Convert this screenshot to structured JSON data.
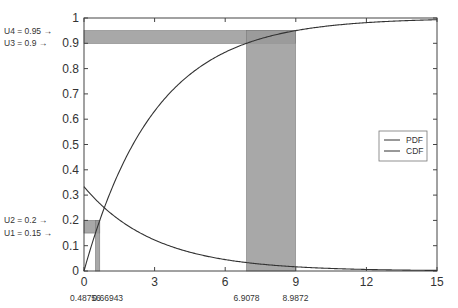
{
  "chart_data": {
    "type": "line",
    "title": "",
    "xlabel": "",
    "ylabel": "",
    "xlim": [
      0,
      15
    ],
    "ylim": [
      0,
      1
    ],
    "grid": false,
    "legend_position": "right-middle",
    "x_ticks": [
      0,
      3,
      6,
      9,
      12,
      15
    ],
    "y_ticks": [
      0,
      0.1,
      0.2,
      0.3,
      0.4,
      0.5,
      0.6,
      0.7,
      0.8,
      0.9,
      1
    ],
    "series": [
      {
        "name": "PDF",
        "function": "(1/3)*exp(-x/3)",
        "x": [
          0,
          3,
          6,
          9,
          12,
          15
        ],
        "values": [
          0.3333,
          0.1226,
          0.0451,
          0.0166,
          0.0061,
          0.0022
        ]
      },
      {
        "name": "CDF",
        "function": "1-exp(-x/3)",
        "x": [
          0,
          3,
          6,
          9,
          12,
          15
        ],
        "values": [
          0,
          0.6321,
          0.8647,
          0.9502,
          0.9817,
          0.9933
        ]
      }
    ],
    "annotations": {
      "u_labels": [
        {
          "label": "U4 = 0.95 →",
          "y": 0.95
        },
        {
          "label": "U3 = 0.9 →",
          "y": 0.9
        },
        {
          "label": "U2 = 0.2 →",
          "y": 0.2
        },
        {
          "label": "U1 = 0.15 →",
          "y": 0.15
        }
      ],
      "x_labels": [
        {
          "label": "0.48756",
          "x": 0.48756
        },
        {
          "label": "0.66943",
          "x": 0.66943
        },
        {
          "label": "6.9078",
          "x": 6.9078
        },
        {
          "label": "8.9872",
          "x": 8.9872
        }
      ],
      "shaded_regions": [
        {
          "y_from": 0.15,
          "y_to": 0.2,
          "x_from": 0,
          "x_to": 0.66943
        },
        {
          "x_from": 0.48756,
          "x_to": 0.66943,
          "y_from": 0,
          "y_to": 0.2
        },
        {
          "y_from": 0.9,
          "y_to": 0.95,
          "x_from": 0,
          "x_to": 8.9872
        },
        {
          "x_from": 6.9078,
          "x_to": 8.9872,
          "y_from": 0,
          "y_to": 0.95
        }
      ]
    }
  },
  "legend": {
    "items": [
      {
        "label": "PDF"
      },
      {
        "label": "CDF"
      }
    ]
  },
  "colors": {
    "line": "#333333",
    "shade": "#999999",
    "axis": "#444444"
  }
}
